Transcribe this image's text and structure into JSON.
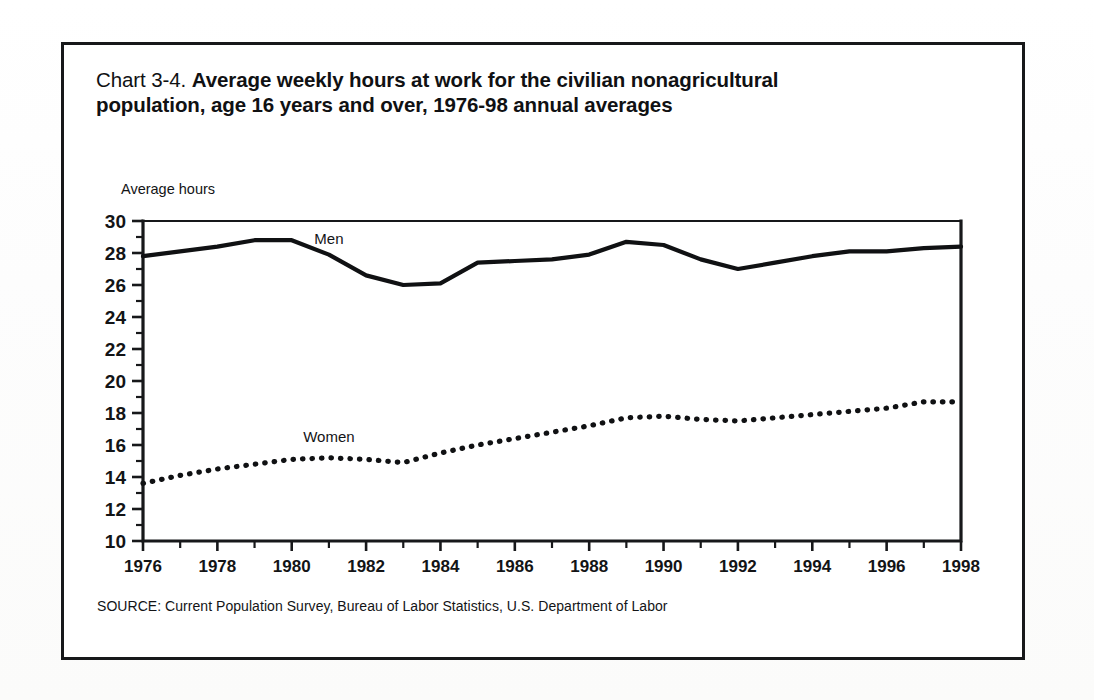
{
  "figure": {
    "title_prefix": "Chart 3-4.",
    "title_main": "Average weekly hours at work for the civilian nonagricultural population, age 16 years and over, 1976-98 annual averages",
    "source_note": "SOURCE: Current Population Survey, Bureau of Labor Statistics, U.S. Department of Labor",
    "border_color": "#17181a"
  },
  "chart_data": {
    "type": "line",
    "title": "Chart 3-4. Average weekly hours at work for the civilian nonagricultural population, age 16 years and over, 1976-98 annual averages",
    "xlabel": "",
    "ylabel": "Average hours",
    "ylim": [
      10,
      30
    ],
    "xlim": [
      1976,
      1998
    ],
    "ytick_step": 2,
    "xtick_step": 2,
    "yticks": [
      10,
      12,
      14,
      16,
      18,
      20,
      22,
      24,
      26,
      28,
      30
    ],
    "xticks": [
      1976,
      1978,
      1980,
      1982,
      1984,
      1986,
      1988,
      1990,
      1992,
      1994,
      1996,
      1998
    ],
    "minor_xticks": [
      1977,
      1979,
      1981,
      1983,
      1985,
      1987,
      1989,
      1991,
      1993,
      1995,
      1997
    ],
    "minor_yticks": [
      11,
      13,
      15,
      17,
      19,
      21,
      23,
      25,
      27,
      29
    ],
    "grid": false,
    "legend_position": "inline-annotations",
    "x": [
      1976,
      1977,
      1978,
      1979,
      1980,
      1981,
      1982,
      1983,
      1984,
      1985,
      1986,
      1987,
      1988,
      1989,
      1990,
      1991,
      1992,
      1993,
      1994,
      1995,
      1996,
      1997,
      1998
    ],
    "series": [
      {
        "name": "Men",
        "style": "solid",
        "color": "#101113",
        "label_x": 1981,
        "label_y": 28.9,
        "values": [
          27.8,
          28.1,
          28.4,
          28.8,
          28.8,
          27.9,
          26.6,
          26.0,
          26.1,
          27.4,
          27.5,
          27.6,
          27.9,
          28.7,
          28.5,
          27.6,
          27.0,
          27.4,
          27.8,
          28.1,
          28.1,
          28.3,
          28.4
        ]
      },
      {
        "name": "Women",
        "style": "dotted",
        "color": "#101113",
        "label_x": 1981,
        "label_y": 16.5,
        "values": [
          13.6,
          14.1,
          14.5,
          14.8,
          15.1,
          15.2,
          15.1,
          14.9,
          15.5,
          16.0,
          16.4,
          16.8,
          17.2,
          17.7,
          17.8,
          17.6,
          17.5,
          17.7,
          17.9,
          18.1,
          18.3,
          18.7,
          18.7
        ]
      }
    ]
  }
}
